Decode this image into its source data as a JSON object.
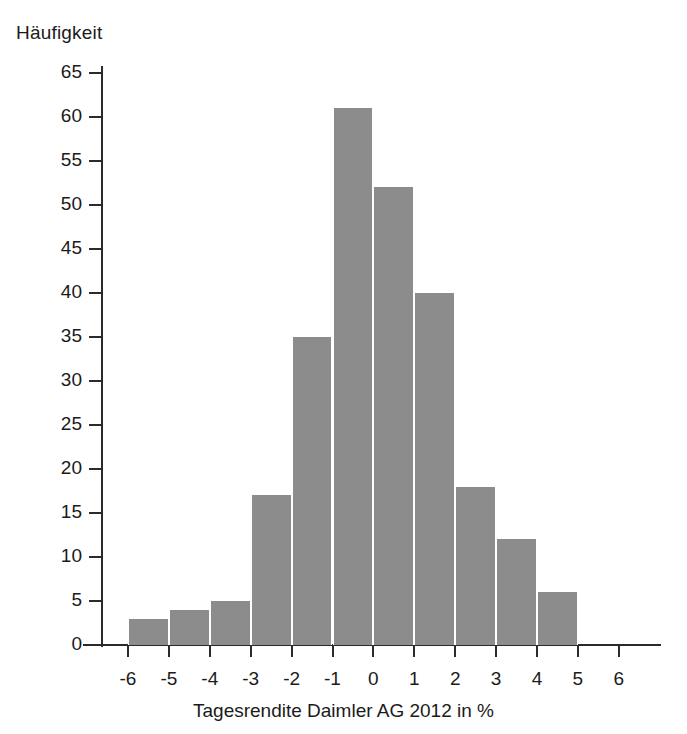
{
  "chart_data": {
    "type": "bar",
    "title": "",
    "subtitle": "",
    "xlabel": "Tagesrendite Daimler AG 2012 in %",
    "ylabel": "Häufigkeit",
    "categories": [
      "-6 bis -5",
      "-5 bis -4",
      "-4 bis -3",
      "-3 bis -2",
      "-2 bis -1",
      "-1 bis 0",
      "0 bis 1",
      "1 bis 2",
      "2 bis 3",
      "3 bis 4",
      "4 bis 5"
    ],
    "bin_edges": [
      -6,
      -5,
      -4,
      -3,
      -2,
      -1,
      0,
      1,
      2,
      3,
      4,
      5
    ],
    "values": [
      3,
      4,
      5,
      17,
      35,
      61,
      52,
      40,
      18,
      12,
      6
    ],
    "xlim": [
      -6.5,
      6.5
    ],
    "ylim": [
      0,
      65
    ],
    "xticks": [
      -6,
      -5,
      -4,
      -3,
      -2,
      -1,
      0,
      1,
      2,
      3,
      4,
      5,
      6
    ],
    "xtick_labels": [
      "-6",
      "-5",
      "-4",
      "-3",
      "-2",
      "-1",
      "0",
      "1",
      "2",
      "3",
      "4",
      "5",
      "6"
    ],
    "yticks": [
      0,
      5,
      10,
      15,
      20,
      25,
      30,
      35,
      40,
      45,
      50,
      55,
      60,
      65
    ],
    "ytick_labels": [
      "0",
      "5",
      "10",
      "15",
      "20",
      "25",
      "30",
      "35",
      "40",
      "45",
      "50",
      "55",
      "60",
      "65"
    ],
    "grid": false,
    "legend": null,
    "bar_color": "#8c8c8c",
    "bar_edge_color": "#ffffff",
    "axis_color": "#2b2b2b",
    "background": "#ffffff"
  }
}
